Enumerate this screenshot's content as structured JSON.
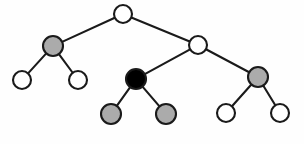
{
  "figure": {
    "name": "binary-tree-diagram",
    "width": 304,
    "height": 144,
    "background_color": "#fefefe",
    "stroke_color": "#1a1a1a",
    "stroke_width": 2.1
  },
  "legend_colors": {
    "white_fill": "#ffffff",
    "gray_fill": "#ababab",
    "black_fill": "#000000",
    "outline": "#1a1a1a"
  },
  "chart_data": {
    "type": "diagram",
    "subtype": "binary-tree",
    "title": "",
    "nodes": [
      {
        "id": "n0",
        "label": "",
        "fill": "white",
        "cx": 123,
        "cy": 14,
        "r": 10,
        "depth": 0,
        "role": "root"
      },
      {
        "id": "n1",
        "label": "",
        "fill": "gray",
        "cx": 53,
        "cy": 46,
        "r": 11,
        "depth": 1,
        "role": "internal"
      },
      {
        "id": "n2",
        "label": "",
        "fill": "white",
        "cx": 198,
        "cy": 45,
        "r": 10,
        "depth": 1,
        "role": "internal"
      },
      {
        "id": "n3",
        "label": "",
        "fill": "white",
        "cx": 22,
        "cy": 80,
        "r": 10,
        "depth": 2,
        "role": "leaf"
      },
      {
        "id": "n4",
        "label": "",
        "fill": "white",
        "cx": 78,
        "cy": 80,
        "r": 10,
        "depth": 2,
        "role": "leaf"
      },
      {
        "id": "n5",
        "label": "",
        "fill": "black",
        "cx": 136,
        "cy": 79,
        "r": 11,
        "depth": 2,
        "role": "internal"
      },
      {
        "id": "n6",
        "label": "",
        "fill": "gray",
        "cx": 258,
        "cy": 77,
        "r": 11,
        "depth": 2,
        "role": "internal"
      },
      {
        "id": "n7",
        "label": "",
        "fill": "gray",
        "cx": 111,
        "cy": 114,
        "r": 11,
        "depth": 3,
        "role": "leaf"
      },
      {
        "id": "n8",
        "label": "",
        "fill": "gray",
        "cx": 166,
        "cy": 114,
        "r": 11,
        "depth": 3,
        "role": "leaf"
      },
      {
        "id": "n9",
        "label": "",
        "fill": "white",
        "cx": 226,
        "cy": 113,
        "r": 10,
        "depth": 3,
        "role": "leaf"
      },
      {
        "id": "n10",
        "label": "",
        "fill": "white",
        "cx": 280,
        "cy": 113,
        "r": 10,
        "depth": 3,
        "role": "leaf"
      }
    ],
    "edges": [
      {
        "from": "n0",
        "to": "n1"
      },
      {
        "from": "n0",
        "to": "n2"
      },
      {
        "from": "n1",
        "to": "n3"
      },
      {
        "from": "n1",
        "to": "n4"
      },
      {
        "from": "n2",
        "to": "n5"
      },
      {
        "from": "n2",
        "to": "n6"
      },
      {
        "from": "n5",
        "to": "n7"
      },
      {
        "from": "n5",
        "to": "n8"
      },
      {
        "from": "n6",
        "to": "n9"
      },
      {
        "from": "n6",
        "to": "n10"
      }
    ]
  }
}
